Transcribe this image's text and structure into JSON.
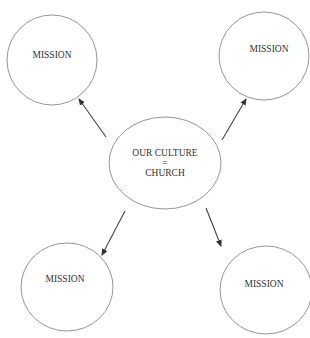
{
  "diagram": {
    "type": "hub-and-spoke",
    "center": {
      "lines": [
        "OUR CULTURE",
        "=",
        "CHURCH"
      ]
    },
    "nodes": [
      {
        "id": "top-left",
        "label": "MISSION"
      },
      {
        "id": "top-right",
        "label": "MISSION"
      },
      {
        "id": "bottom-left",
        "label": "MISSION"
      },
      {
        "id": "bottom-right",
        "label": "MISSION"
      }
    ],
    "edges": [
      {
        "from": "center",
        "to": "top-left"
      },
      {
        "from": "center",
        "to": "top-right"
      },
      {
        "from": "center",
        "to": "bottom-left"
      },
      {
        "from": "center",
        "to": "bottom-right"
      }
    ],
    "colors": {
      "outline": "#8a8a8a",
      "arrow": "#444444",
      "text": "#333333"
    }
  }
}
